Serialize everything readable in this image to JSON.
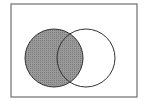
{
  "diagram": {
    "type": "venn",
    "universe": {
      "x": 11,
      "y": 4,
      "width": 126,
      "height": 93,
      "stroke": "#6e6e6e"
    },
    "sets": [
      {
        "name": "A",
        "cx": 54,
        "cy": 58,
        "r": 29,
        "shaded": true
      },
      {
        "name": "B",
        "cx": 86,
        "cy": 58,
        "r": 29,
        "shaded": false
      }
    ],
    "shaded_region": "A",
    "colors": {
      "shade": "#8c8c8c",
      "outline": "#333333",
      "background": "#ffffff"
    }
  }
}
